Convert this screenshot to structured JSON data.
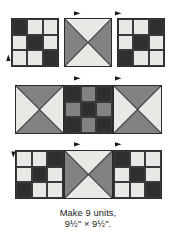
{
  "figure": {
    "kind": "quilt-block-assembly-diagram",
    "caption_line1": "Make 9 units,",
    "caption_line2": "9½\" × 9½\"."
  },
  "palette": {
    "dark": "#2f2f2f",
    "medium": "#828282",
    "light": "#e8e8e5",
    "outline": "#2b2b2b",
    "arrow": "#1a1a1a",
    "background": "#ffffff",
    "text": "#1a1a1a"
  },
  "legend": {
    "dark_label": "dark",
    "medium_label": "medium",
    "light_label": "light"
  },
  "rows": [
    {
      "name": "top-row",
      "blocks": [
        {
          "name": "nine-patch-top-left",
          "type": "nine-patch",
          "cells": [
            "dark",
            "light",
            "light",
            "light",
            "dark",
            "light",
            "light",
            "light",
            "dark"
          ]
        },
        {
          "name": "hourglass-top-center",
          "type": "hourglass",
          "top": "light",
          "right": "medium",
          "bottom": "light",
          "left": "medium"
        },
        {
          "name": "nine-patch-top-right",
          "type": "nine-patch",
          "cells": [
            "light",
            "light",
            "dark",
            "light",
            "dark",
            "light",
            "dark",
            "light",
            "light"
          ]
        }
      ]
    },
    {
      "name": "middle-row",
      "blocks": [
        {
          "name": "hourglass-middle-left",
          "type": "hourglass",
          "top": "medium",
          "right": "light",
          "bottom": "medium",
          "left": "light"
        },
        {
          "name": "nine-patch-middle-center",
          "type": "nine-patch",
          "cells": [
            "dark",
            "medium",
            "dark",
            "medium",
            "dark",
            "medium",
            "dark",
            "medium",
            "dark"
          ]
        },
        {
          "name": "hourglass-middle-right",
          "type": "hourglass",
          "top": "medium",
          "right": "light",
          "bottom": "medium",
          "left": "light"
        }
      ]
    },
    {
      "name": "bottom-row",
      "blocks": [
        {
          "name": "nine-patch-bottom-left",
          "type": "nine-patch",
          "cells": [
            "light",
            "light",
            "dark",
            "light",
            "dark",
            "light",
            "dark",
            "light",
            "light"
          ]
        },
        {
          "name": "hourglass-bottom-center",
          "type": "hourglass",
          "top": "light",
          "right": "medium",
          "bottom": "light",
          "left": "medium"
        },
        {
          "name": "nine-patch-bottom-right",
          "type": "nine-patch",
          "cells": [
            "dark",
            "light",
            "light",
            "light",
            "dark",
            "light",
            "light",
            "light",
            "dark"
          ]
        }
      ]
    }
  ],
  "arrows": [
    {
      "name": "pressing-arrow-top-left",
      "direction": "right"
    },
    {
      "name": "pressing-arrow-top-right",
      "direction": "right"
    },
    {
      "name": "pressing-arrow-middle-left",
      "direction": "right"
    },
    {
      "name": "pressing-arrow-middle-right",
      "direction": "right"
    },
    {
      "name": "pressing-arrow-bottom-left",
      "direction": "right"
    },
    {
      "name": "pressing-arrow-bottom-right",
      "direction": "right"
    },
    {
      "name": "pressing-arrow-side-up",
      "direction": "up"
    },
    {
      "name": "pressing-arrow-side-down",
      "direction": "down"
    }
  ]
}
